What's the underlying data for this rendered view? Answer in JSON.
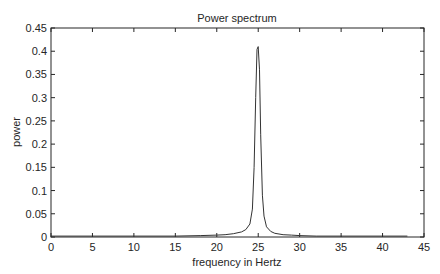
{
  "chart_data": {
    "type": "line",
    "title": "Power spectrum",
    "xlabel": "frequency in Hertz",
    "ylabel": "power",
    "xlim": [
      0,
      45
    ],
    "ylim": [
      0,
      0.45
    ],
    "xticks": [
      0,
      5,
      10,
      15,
      20,
      25,
      30,
      35,
      40,
      45
    ],
    "yticks": [
      0,
      0.05,
      0.1,
      0.15,
      0.2,
      0.25,
      0.3,
      0.35,
      0.4,
      0.45
    ],
    "xtick_labels": [
      "0",
      "5",
      "10",
      "15",
      "20",
      "25",
      "30",
      "35",
      "40",
      "45"
    ],
    "ytick_labels": [
      "0",
      "0.05",
      "0.1",
      "0.15",
      "0.2",
      "0.25",
      "0.3",
      "0.35",
      "0.4",
      "0.45"
    ],
    "grid": false,
    "legend": null,
    "series": [
      {
        "name": "power spectrum",
        "color": "#333333",
        "x": [
          0,
          5,
          10,
          15,
          18,
          20,
          21,
          22,
          23,
          23.5,
          24,
          24.3,
          24.5,
          24.7,
          24.85,
          25.0,
          25.15,
          25.3,
          25.5,
          25.7,
          26,
          26.5,
          27,
          28,
          29,
          30,
          32,
          35,
          40,
          43
        ],
        "y": [
          0.002,
          0.002,
          0.002,
          0.002,
          0.003,
          0.004,
          0.005,
          0.007,
          0.011,
          0.016,
          0.028,
          0.06,
          0.15,
          0.3,
          0.404,
          0.41,
          0.36,
          0.22,
          0.09,
          0.045,
          0.022,
          0.012,
          0.008,
          0.005,
          0.004,
          0.003,
          0.002,
          0.002,
          0.002,
          0.002
        ]
      }
    ]
  }
}
